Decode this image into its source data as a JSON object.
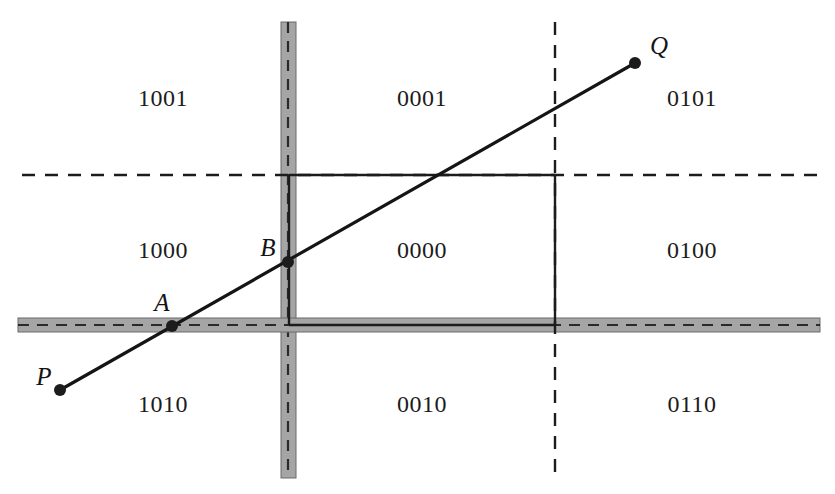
{
  "figure": {
    "width": 835,
    "height": 494,
    "background": "#ffffff",
    "ink_color": "#1c1c1c",
    "band_fill": "#9a9a9a",
    "band_edge": "#6e6e6e"
  },
  "regions": [
    {
      "code": "1001",
      "x": 163,
      "y": 98
    },
    {
      "code": "0001",
      "x": 422,
      "y": 98
    },
    {
      "code": "0101",
      "x": 692,
      "y": 98
    },
    {
      "code": "1000",
      "x": 163,
      "y": 250
    },
    {
      "code": "0000",
      "x": 422,
      "y": 250
    },
    {
      "code": "0100",
      "x": 692,
      "y": 250
    },
    {
      "code": "1010",
      "x": 163,
      "y": 404
    },
    {
      "code": "0010",
      "x": 422,
      "y": 404
    },
    {
      "code": "0110",
      "x": 692,
      "y": 404
    }
  ],
  "points": [
    {
      "name": "P",
      "label": "P",
      "cx": 60,
      "cy": 390,
      "lx": 44,
      "ly": 377,
      "r": 6
    },
    {
      "name": "A",
      "label": "A",
      "cx": 172,
      "cy": 326,
      "lx": 162,
      "ly": 303,
      "r": 6
    },
    {
      "name": "B",
      "label": "B",
      "cx": 288,
      "cy": 262,
      "lx": 268,
      "ly": 248,
      "r": 6
    },
    {
      "name": "Q",
      "label": "Q",
      "cx": 635,
      "cy": 63,
      "lx": 659,
      "ly": 46,
      "r": 6
    }
  ],
  "segment": {
    "name": "PQ",
    "x1": 60,
    "y1": 390,
    "x2": 635,
    "y2": 63,
    "stroke_width": 3.2
  },
  "clip_window": {
    "left": 289,
    "top": 175,
    "right": 555,
    "bottom": 325,
    "stroke_width": 2.4
  },
  "boundaries": {
    "vertical_band": {
      "x": 281,
      "width": 15,
      "y_top": 22,
      "y_bottom": 478,
      "dash_x": 288
    },
    "horizontal_band": {
      "y": 318,
      "height": 14,
      "x_left": 18,
      "x_right": 820,
      "dash_y": 325
    },
    "top_dashed": {
      "y": 175,
      "x_left": 22,
      "x_right": 820
    },
    "right_dashed": {
      "x": 555,
      "y_top": 22,
      "y_bottom": 478
    }
  }
}
